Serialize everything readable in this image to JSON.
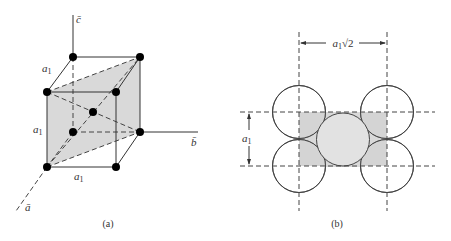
{
  "figure": {
    "panel_a": {
      "caption": "(a)",
      "axes": {
        "c": "c̄",
        "b": "b̄",
        "a": "ā"
      },
      "edge_labels": {
        "top": "a",
        "left": "a",
        "bottom": "a",
        "subscript": "1"
      },
      "shading_color": "#d9d9d9",
      "atom_color": "#000000"
    },
    "panel_b": {
      "caption": "(b)",
      "horizontal_dimension": {
        "base": "a",
        "subscript": "1",
        "suffix": "√2"
      },
      "vertical_dimension": {
        "base": "a",
        "subscript": "1"
      },
      "corner_fill": "#d9d9d9",
      "center_fill": "#e2e2e2"
    }
  }
}
